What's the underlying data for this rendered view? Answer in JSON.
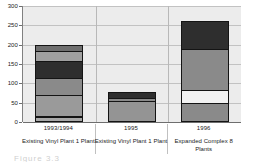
{
  "chart_data": {
    "type": "bar",
    "subtype": "stacked",
    "title": "",
    "xlabel": "",
    "ylabel": "",
    "ylim": [
      0,
      300
    ],
    "yticks": [
      0,
      50,
      100,
      150,
      200,
      250,
      300
    ],
    "ytick_labels": [
      "0",
      "50",
      "100",
      "150",
      "200",
      "250",
      "300"
    ],
    "grid": true,
    "legend": "none",
    "categories": [
      "1993/1994",
      "1995",
      "1996"
    ],
    "category_subtitles": [
      "Existing Vinyl Plant 1 Plant",
      "Existing Vinyl Plant 1 Plant",
      "Expanded Complex 8 Plants"
    ],
    "bar_totals": [
      200,
      78,
      260
    ],
    "stacks": [
      {
        "category": "1993/1994",
        "total": 200,
        "segments": [
          {
            "value": 10,
            "color": "#a8a8a8"
          },
          {
            "value": 4,
            "color": "#f2f2f2"
          },
          {
            "value": 55,
            "color": "#9a9a9a"
          },
          {
            "value": 46,
            "color": "#8a8a8a"
          },
          {
            "value": 45,
            "color": "#2e2e2e"
          },
          {
            "value": 26,
            "color": "#a0a0a0"
          },
          {
            "value": 14,
            "color": "#6e6e6e"
          }
        ]
      },
      {
        "category": "1995",
        "total": 78,
        "segments": [
          {
            "value": 55,
            "color": "#949494"
          },
          {
            "value": 10,
            "color": "#8a8a8a"
          },
          {
            "value": 13,
            "color": "#2e2e2e"
          }
        ]
      },
      {
        "category": "1996",
        "total": 260,
        "segments": [
          {
            "value": 47,
            "color": "#8a8a8a"
          },
          {
            "value": 35,
            "color": "#f2f2f2"
          },
          {
            "value": 108,
            "color": "#8a8a8a"
          },
          {
            "value": 70,
            "color": "#2e2e2e"
          }
        ]
      }
    ]
  },
  "caption": {
    "text": "Figure 3.3"
  }
}
